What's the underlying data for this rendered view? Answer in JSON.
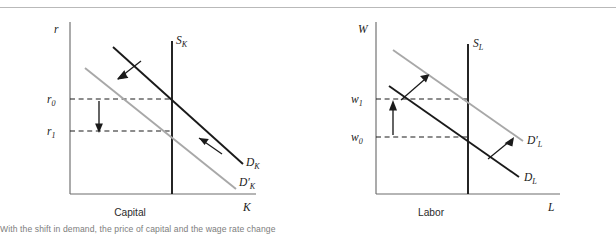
{
  "figure": {
    "panels": [
      {
        "id": "capital",
        "caption": "Capital",
        "y_axis_label": "r",
        "x_axis_label": "K",
        "supply_label": "S",
        "supply_sub": "K",
        "demand_old_label": "D",
        "demand_old_sub": "K",
        "demand_new_label": "D′",
        "demand_new_sub": "K",
        "tick_high_label": "r",
        "tick_high_sub": "0",
        "tick_low_label": "r",
        "tick_low_sub": "1",
        "shift_direction": "left",
        "price_arrow_direction": "down"
      },
      {
        "id": "labor",
        "caption": "Labor",
        "y_axis_label": "W",
        "x_axis_label": "L",
        "supply_label": "S",
        "supply_sub": "L",
        "demand_old_label": "D",
        "demand_old_sub": "L",
        "demand_new_label": "D′",
        "demand_new_sub": "L",
        "tick_high_label": "w",
        "tick_high_sub": "1",
        "tick_low_label": "w",
        "tick_low_sub": "0",
        "shift_direction": "right",
        "price_arrow_direction": "up"
      }
    ],
    "footnote": "With the shift in demand, the price of capital and the wage rate change"
  },
  "chart_data": {
    "type": "line",
    "title": "",
    "panels": [
      {
        "name": "Capital",
        "xlabel": "K",
        "ylabel": "r",
        "series": [
          {
            "name": "S_K",
            "type": "vertical-supply",
            "x": 0.52
          },
          {
            "name": "D_K",
            "type": "demand",
            "points": [
              [
                0.18,
                0.9
              ],
              [
                0.92,
                0.2
              ]
            ]
          },
          {
            "name": "D'_K",
            "type": "demand-shifted",
            "points": [
              [
                0.06,
                0.78
              ],
              [
                0.8,
                0.08
              ]
            ]
          }
        ],
        "equilibria": [
          {
            "label": "r_0",
            "y": 0.545,
            "curve": "D_K"
          },
          {
            "label": "r_1",
            "y": 0.355,
            "curve": "D'_K"
          }
        ],
        "annotations": [
          "leftward shift arrow (upper)",
          "leftward shift arrow (lower)",
          "downward price arrow r_0 to r_1"
        ]
      },
      {
        "name": "Labor",
        "xlabel": "L",
        "ylabel": "W",
        "series": [
          {
            "name": "S_L",
            "type": "vertical-supply",
            "x": 0.52
          },
          {
            "name": "D_L",
            "type": "demand",
            "points": [
              [
                0.06,
                0.78
              ],
              [
                0.8,
                0.14
              ]
            ]
          },
          {
            "name": "D'_L",
            "type": "demand-shifted",
            "points": [
              [
                0.14,
                0.92
              ],
              [
                0.88,
                0.28
              ]
            ]
          }
        ],
        "equilibria": [
          {
            "label": "w_0",
            "y": 0.355,
            "curve": "D_L"
          },
          {
            "label": "w_1",
            "y": 0.545,
            "curve": "D'_L"
          }
        ],
        "annotations": [
          "rightward shift arrow (upper)",
          "rightward shift arrow (lower)",
          "upward wage arrow w_0 to w_1"
        ]
      }
    ]
  }
}
